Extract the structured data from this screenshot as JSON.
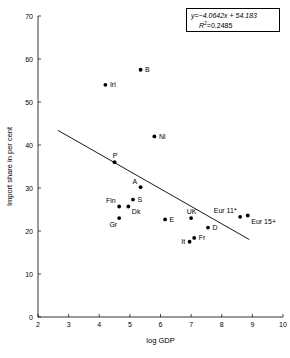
{
  "chart_data": {
    "type": "scatter",
    "title": "",
    "xlabel": "log GDP",
    "ylabel": "Import share in per cent",
    "xlim": [
      2,
      10
    ],
    "ylim": [
      0,
      70
    ],
    "xticks": [
      2,
      3,
      4,
      5,
      6,
      7,
      8,
      9,
      10
    ],
    "yticks": [
      0,
      10,
      20,
      30,
      40,
      50,
      60,
      70
    ],
    "grid": false,
    "legend": "none",
    "points": [
      {
        "label": "B",
        "x": 5.35,
        "y": 57.5,
        "label_pos": "right"
      },
      {
        "label": "Irl",
        "x": 4.2,
        "y": 54.0,
        "label_pos": "right"
      },
      {
        "label": "Nl",
        "x": 5.8,
        "y": 42.0,
        "label_pos": "right"
      },
      {
        "label": "P",
        "x": 4.5,
        "y": 36.0,
        "label_pos": "above"
      },
      {
        "label": "A",
        "x": 5.35,
        "y": 30.2,
        "label_pos": "above-left"
      },
      {
        "label": "S",
        "x": 5.1,
        "y": 27.3,
        "label_pos": "right"
      },
      {
        "label": "Fin",
        "x": 4.65,
        "y": 25.7,
        "label_pos": "above-left"
      },
      {
        "label": "Dk",
        "x": 4.95,
        "y": 25.7,
        "label_pos": "below-right"
      },
      {
        "label": "Gr",
        "x": 4.65,
        "y": 23.0,
        "label_pos": "below-left"
      },
      {
        "label": "E",
        "x": 6.15,
        "y": 22.7,
        "label_pos": "right"
      },
      {
        "label": "UK",
        "x": 7.0,
        "y": 23.0,
        "label_pos": "above"
      },
      {
        "label": "D",
        "x": 7.55,
        "y": 20.8,
        "label_pos": "right"
      },
      {
        "label": "It",
        "x": 6.95,
        "y": 17.5,
        "label_pos": "left"
      },
      {
        "label": "Fr",
        "x": 7.1,
        "y": 18.4,
        "label_pos": "right"
      },
      {
        "label": "Eur 11*",
        "x": 8.6,
        "y": 23.3,
        "label_pos": "above-left"
      },
      {
        "label": "Eur 15+",
        "x": 8.85,
        "y": 23.6,
        "label_pos": "below-right"
      }
    ],
    "trendline": {
      "slope": -4.0642,
      "intercept": 54.183,
      "x_start": 2.65,
      "x_end": 8.9
    },
    "annotation": {
      "equation_y": "y",
      "equation_body": "=−4.0642x + 54.183",
      "r2_symbol": "R",
      "r2_exp": "2",
      "r2_value": "=0.2485"
    }
  }
}
